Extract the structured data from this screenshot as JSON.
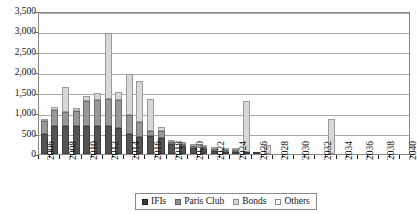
{
  "chart_data": {
    "type": "bar",
    "stacked": true,
    "title": "",
    "subtitle": "",
    "xlabel": "",
    "ylabel": "",
    "ylim": [
      0,
      3500
    ],
    "ytick_labels": [
      "0",
      "500",
      "1,000",
      "1,500",
      "2,000",
      "2,500",
      "3,000",
      "3,500"
    ],
    "ytick_values": [
      0,
      500,
      1000,
      1500,
      2000,
      2500,
      3000,
      3500
    ],
    "grid": true,
    "legend_position": "bottom",
    "categories": [
      "2006",
      "2007",
      "2008",
      "2009",
      "2010",
      "2011",
      "2012",
      "2013",
      "2014",
      "2015",
      "2016",
      "2017",
      "2018",
      "2019",
      "2020",
      "2021",
      "2022",
      "2023",
      "2024",
      "2025",
      "2026",
      "2027",
      "2028",
      "2029",
      "2030",
      "2031",
      "2032",
      "2033",
      "2034",
      "2035",
      "2036",
      "2037",
      "2038",
      "2039",
      "2040"
    ],
    "xtick_labels": [
      "2006",
      "2008",
      "2010",
      "2012",
      "2014",
      "2016",
      "2018",
      "2020",
      "2022",
      "2024",
      "2026",
      "2028",
      "2030",
      "2032",
      "2034",
      "2036",
      "2038",
      "2040"
    ],
    "series": [
      {
        "name": "IFIs",
        "color": "#545454",
        "values": [
          500,
          690,
          680,
          690,
          690,
          690,
          690,
          640,
          490,
          420,
          430,
          390,
          250,
          195,
          150,
          130,
          75,
          45,
          25,
          10,
          8,
          0,
          0,
          0,
          0,
          0,
          0,
          0,
          0,
          0,
          0,
          0,
          0,
          0,
          0
        ]
      },
      {
        "name": "Paris Club",
        "color": "#989898",
        "values": [
          300,
          380,
          350,
          370,
          600,
          625,
          660,
          690,
          470,
          370,
          130,
          165,
          55,
          35,
          25,
          20,
          10,
          5,
          3,
          0,
          0,
          0,
          0,
          0,
          0,
          0,
          0,
          0,
          0,
          0,
          0,
          0,
          0,
          0,
          0
        ]
      },
      {
        "name": "Bonds",
        "color": "#d8d8d8",
        "values": [
          30,
          75,
          620,
          75,
          130,
          180,
          1620,
          180,
          1010,
          990,
          790,
          95,
          10,
          5,
          5,
          5,
          5,
          5,
          3,
          1240,
          0,
          230,
          0,
          0,
          0,
          0,
          0,
          850,
          0,
          0,
          0,
          0,
          0,
          0,
          0
        ]
      },
      {
        "name": "Others",
        "color": "#ffffff",
        "values": [
          0,
          0,
          0,
          0,
          0,
          0,
          0,
          0,
          0,
          0,
          0,
          0,
          0,
          0,
          0,
          0,
          0,
          0,
          0,
          0,
          0,
          0,
          0,
          0,
          0,
          0,
          0,
          0,
          0,
          0,
          0,
          0,
          0,
          0,
          0
        ]
      }
    ],
    "totals": [
      830,
      1145,
      1650,
      1135,
      1420,
      1495,
      2970,
      1510,
      1970,
      1780,
      1350,
      650,
      315,
      235,
      180,
      155,
      90,
      55,
      31,
      1250,
      8,
      230,
      0,
      0,
      0,
      0,
      0,
      850,
      0,
      0,
      0,
      0,
      0,
      0,
      0
    ]
  },
  "legend": {
    "items": [
      {
        "label": "IFIs"
      },
      {
        "label": "Paris Club"
      },
      {
        "label": "Bonds"
      },
      {
        "label": "Others"
      }
    ]
  }
}
